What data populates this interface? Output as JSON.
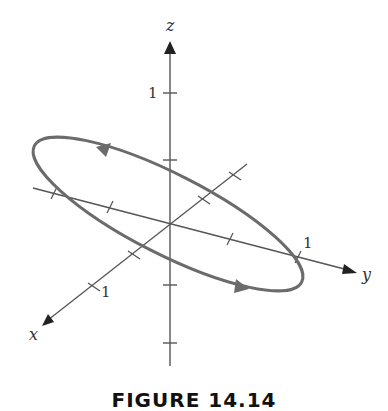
{
  "figure": {
    "caption": "FIGURE 14.14",
    "axes": {
      "x": {
        "label": "x",
        "tick_label": "1"
      },
      "y": {
        "label": "y",
        "tick_label": "1"
      },
      "z": {
        "label": "z",
        "tick_label": "1"
      }
    },
    "curve": {
      "description": "closed elliptical curve tilted in 3D with direction arrows",
      "color": "#6b6b6b"
    },
    "colors": {
      "axis": "#555555",
      "curve": "#6b6b6b",
      "arrowhead": "#222222"
    }
  }
}
